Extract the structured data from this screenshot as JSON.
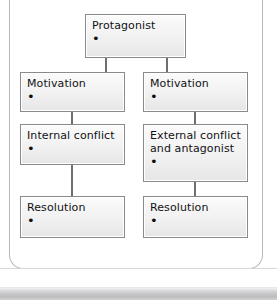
{
  "diagram": {
    "type": "flowchart",
    "title_text": "Story structure chart",
    "bullet_glyph": "•",
    "colors": {
      "node_border": "#8a8a8e",
      "node_fill_top": "#fbfbfb",
      "node_fill_bottom": "#e6e6e6",
      "connector": "#6f6f72",
      "frame_border": "#b9b9bd",
      "text": "#111113",
      "bottom_strip": "#c9c9cb"
    },
    "nodes": [
      {
        "id": "protagonist",
        "label": "Protagonist",
        "bullet": "•"
      },
      {
        "id": "motivation-left",
        "label": "Motivation",
        "bullet": "•"
      },
      {
        "id": "motivation-right",
        "label": "Motivation",
        "bullet": "•"
      },
      {
        "id": "internal-conflict",
        "label": "Internal conflict",
        "bullet": "•"
      },
      {
        "id": "external-conflict",
        "label": "External conflict\nand antagonist",
        "bullet": "•"
      },
      {
        "id": "resolution-left",
        "label": "Resolution",
        "bullet": "•"
      },
      {
        "id": "resolution-right",
        "label": "Resolution",
        "bullet": "•"
      }
    ],
    "edges": [
      {
        "from": "protagonist",
        "to": "motivation-left"
      },
      {
        "from": "protagonist",
        "to": "motivation-right"
      },
      {
        "from": "motivation-left",
        "to": "internal-conflict"
      },
      {
        "from": "motivation-right",
        "to": "external-conflict"
      },
      {
        "from": "internal-conflict",
        "to": "resolution-left"
      },
      {
        "from": "external-conflict",
        "to": "resolution-right"
      }
    ]
  }
}
